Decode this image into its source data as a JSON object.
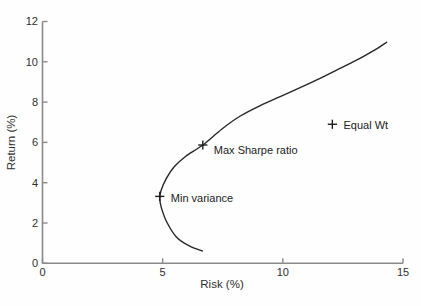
{
  "figure": {
    "width": 421,
    "height": 306,
    "background": "#fefefe"
  },
  "chart_data": {
    "type": "line",
    "title": "",
    "xlabel": "Risk (%)",
    "ylabel": "Return (%)",
    "xlim": [
      0,
      15
    ],
    "ylim": [
      0,
      12
    ],
    "x_ticks": [
      0,
      5,
      10,
      15
    ],
    "y_ticks": [
      0,
      2,
      4,
      6,
      8,
      10,
      12
    ],
    "grid": false,
    "legend": "none",
    "series": [
      {
        "name": "efficient-frontier",
        "points": [
          [
            6.65,
            0.61
          ],
          [
            6.11,
            0.86
          ],
          [
            5.57,
            1.31
          ],
          [
            5.17,
            2.05
          ],
          [
            4.95,
            2.74
          ],
          [
            4.88,
            3.19
          ],
          [
            4.93,
            3.6
          ],
          [
            5.16,
            4.23
          ],
          [
            5.49,
            4.8
          ],
          [
            5.95,
            5.3
          ],
          [
            6.67,
            5.87
          ],
          [
            7.48,
            6.68
          ],
          [
            8.23,
            7.31
          ],
          [
            9.06,
            7.83
          ],
          [
            9.89,
            8.27
          ],
          [
            10.72,
            8.72
          ],
          [
            11.55,
            9.18
          ],
          [
            12.38,
            9.67
          ],
          [
            13.21,
            10.17
          ],
          [
            13.85,
            10.6
          ],
          [
            14.32,
            10.97
          ]
        ]
      }
    ],
    "annotations": [
      {
        "id": "min-variance",
        "label": "Min variance",
        "x": 4.88,
        "y": 3.32,
        "marker": "+",
        "label_dx": 11,
        "label_dy": 5.5
      },
      {
        "id": "max-sharpe",
        "label": "Max Sharpe ratio",
        "x": 6.67,
        "y": 5.87,
        "marker": "+",
        "label_dx": 11,
        "label_dy": 8.5
      },
      {
        "id": "equal-wt",
        "label": "Equal Wt",
        "x": 12.06,
        "y": 6.9,
        "marker": "+",
        "label_dx": 11.2,
        "label_dy": 5
      }
    ],
    "colors": {
      "curve": "#262626",
      "axis": "#8a8a8a",
      "tick_text": "#2e2e2e",
      "marker": "#1e1e1e",
      "background": "#fefefe"
    },
    "layout_hints": {
      "plot_left": 42.5,
      "plot_right": 403,
      "plot_top": 21.5,
      "plot_bottom": 263.3,
      "tick_length": 5,
      "x_title_pos": [
        222,
        287.5
      ],
      "y_title_pos": [
        15,
        142.5
      ]
    }
  }
}
